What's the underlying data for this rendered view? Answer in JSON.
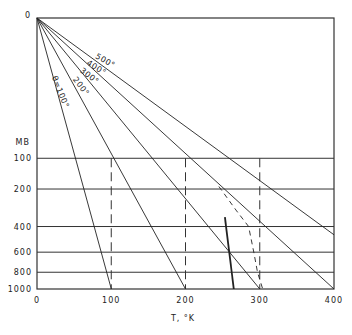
{
  "chart_data": {
    "type": "line",
    "title": "",
    "xlabel": "T, °K",
    "ylabel": "MB",
    "xlim": [
      0,
      400
    ],
    "ylim": [
      0,
      1000
    ],
    "y_scale": "p^0.286 (Poisson / Stüve-type), increasing downward",
    "x_ticks": [
      0,
      100,
      200,
      300,
      400
    ],
    "y_ticks": [
      100,
      200,
      400,
      600,
      800,
      1000
    ],
    "y_top_label": "0",
    "grid": {
      "horizontal_solid_at_mb": [
        100,
        200,
        400,
        600,
        800
      ],
      "vertical_dashed_at_K": [
        100,
        200,
        300
      ],
      "vertical_dashed_from_mb": 100
    },
    "series": [
      {
        "name": "θ=100°",
        "kind": "dry adiabat",
        "label": "θ=100°",
        "points": [
          [
            0,
            0
          ],
          [
            100,
            1000
          ]
        ]
      },
      {
        "name": "200°",
        "kind": "dry adiabat",
        "label": "200°",
        "points": [
          [
            0,
            0
          ],
          [
            200,
            1000
          ]
        ]
      },
      {
        "name": "300°",
        "kind": "dry adiabat",
        "label": "300°",
        "points": [
          [
            0,
            0
          ],
          [
            300,
            1000
          ]
        ]
      },
      {
        "name": "400°",
        "kind": "dry adiabat",
        "label": "400°",
        "points": [
          [
            0,
            0
          ],
          [
            400,
            1000
          ]
        ]
      },
      {
        "name": "500°",
        "kind": "dry adiabat",
        "label": "500°",
        "points": [
          [
            0,
            0
          ],
          [
            400,
            458
          ]
        ]
      },
      {
        "name": "dashed curve",
        "kind": "dashed curve",
        "label": "",
        "points": [
          [
            245,
            190
          ],
          [
            268,
            300
          ],
          [
            285,
            400
          ],
          [
            292,
            600
          ],
          [
            297,
            800
          ],
          [
            304,
            1000
          ]
        ]
      },
      {
        "name": "bold line",
        "kind": "solid bold",
        "label": "",
        "points": [
          [
            253,
            340
          ],
          [
            265,
            1000
          ]
        ]
      }
    ],
    "annotations": [
      {
        "text": "500°",
        "x": 104,
        "y": 63,
        "rotate": 30
      },
      {
        "text": "400°",
        "x": 95,
        "y": 70,
        "rotate": 32
      },
      {
        "text": "300°",
        "x": 88,
        "y": 78,
        "rotate": 38
      },
      {
        "text": "200°",
        "x": 79,
        "y": 88,
        "rotate": 52
      },
      {
        "text": "θ=100°",
        "x": 58,
        "y": 93,
        "rotate": 68
      }
    ]
  },
  "layout": {
    "plot_left": 37,
    "plot_right": 334,
    "plot_top": 18,
    "plot_bottom": 289,
    "kappa": 0.286,
    "line_color": "#222222",
    "grid_color": "#333333"
  }
}
